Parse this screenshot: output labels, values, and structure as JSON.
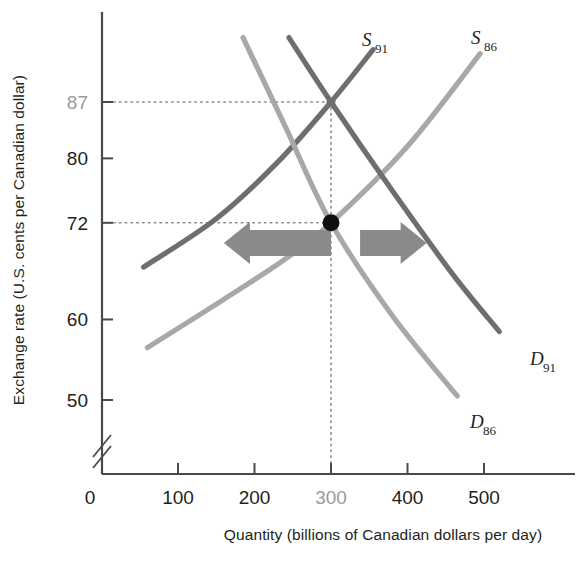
{
  "chart_data": {
    "type": "line",
    "title": "",
    "xlabel": "Quantity (billions of Canadian dollars per day)",
    "ylabel": "Exchange rate (U.S. cents per Canadian dollar)",
    "xlim": [
      0,
      560
    ],
    "ylim": [
      44,
      95
    ],
    "grid": false,
    "legend": "inline curve labels",
    "axis_break": "y-axis break between 0 and 50",
    "x_ticks": [
      {
        "value": 0,
        "label": "0",
        "highlight": false
      },
      {
        "value": 100,
        "label": "100",
        "highlight": false
      },
      {
        "value": 200,
        "label": "200",
        "highlight": false
      },
      {
        "value": 300,
        "label": "300",
        "highlight": true
      },
      {
        "value": 400,
        "label": "400",
        "highlight": false
      },
      {
        "value": 500,
        "label": "500",
        "highlight": false
      }
    ],
    "y_ticks": [
      {
        "value": 50,
        "label": "50",
        "highlight": false
      },
      {
        "value": 60,
        "label": "60",
        "highlight": false
      },
      {
        "value": 72,
        "label": "72",
        "highlight": false
      },
      {
        "value": 80,
        "label": "80",
        "highlight": false
      },
      {
        "value": 87,
        "label": "87",
        "highlight": true
      }
    ],
    "series": [
      {
        "name": "S91",
        "label_main": "S",
        "label_sub": "91",
        "kind": "supply",
        "color": "#6e6e6e",
        "points": [
          [
            55,
            66.5
          ],
          [
            150,
            72.5
          ],
          [
            230,
            79.5
          ],
          [
            300,
            87.0
          ],
          [
            355,
            93.5
          ]
        ]
      },
      {
        "name": "S86",
        "label_main": "S",
        "label_sub": "86",
        "kind": "supply",
        "color": "#a8a8a8",
        "points": [
          [
            60,
            56.5
          ],
          [
            160,
            62.5
          ],
          [
            240,
            67.5
          ],
          [
            300,
            72.0
          ],
          [
            400,
            81.5
          ],
          [
            495,
            93.0
          ]
        ]
      },
      {
        "name": "D91",
        "label_main": "D",
        "label_sub": "91",
        "kind": "demand",
        "color": "#6e6e6e",
        "points": [
          [
            245,
            95.0
          ],
          [
            300,
            87.0
          ],
          [
            380,
            76.0
          ],
          [
            460,
            65.5
          ],
          [
            520,
            58.5
          ]
        ]
      },
      {
        "name": "D86",
        "label_main": "D",
        "label_sub": "86",
        "kind": "demand",
        "color": "#a8a8a8",
        "points": [
          [
            185,
            95.0
          ],
          [
            240,
            84.0
          ],
          [
            300,
            72.0
          ],
          [
            380,
            60.5
          ],
          [
            465,
            50.5
          ]
        ]
      }
    ],
    "equilibria": [
      {
        "name": "equilibrium-1986",
        "x": 300,
        "y": 72,
        "marker": "filled-dot",
        "color": "#111111"
      },
      {
        "name": "equilibrium-1991",
        "x": 300,
        "y": 87,
        "marker": "crossing",
        "color": "#6e6e6e"
      }
    ],
    "guide_lines": [
      {
        "name": "guide-87",
        "orientation": "horizontal",
        "value": 87,
        "style": "dotted"
      },
      {
        "name": "guide-72",
        "orientation": "horizontal",
        "value": 72,
        "style": "dotted"
      },
      {
        "name": "guide-300",
        "orientation": "vertical",
        "value": 300,
        "style": "dotted"
      }
    ],
    "annotations": [
      {
        "name": "arrow-left",
        "direction": "left",
        "y": 69.5,
        "from_x": 300,
        "to_x": 160,
        "color": "#8a8a8a"
      },
      {
        "name": "arrow-right",
        "direction": "right",
        "y": 69.5,
        "from_x": 338,
        "to_x": 425,
        "color": "#8a8a8a"
      }
    ]
  },
  "labels": {
    "x_axis_title": "Quantity (billions of Canadian dollars per day)",
    "y_axis_title": "Exchange rate (U.S. cents per Canadian dollar)"
  }
}
